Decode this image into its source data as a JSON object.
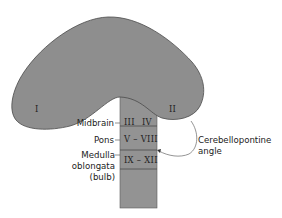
{
  "diagram": {
    "regions": {
      "left_hemisphere": "I",
      "right_hemisphere": "II"
    },
    "brainstem": [
      {
        "level": "Midbrain",
        "nerves": [
          "III",
          "IV"
        ]
      },
      {
        "level": "Pons",
        "nerves_range": "V – VIII"
      },
      {
        "level": "Medulla oblongata (bulb)",
        "nerves_range": "IX – XII"
      }
    ],
    "labels": {
      "midbrain": "Midbrain",
      "pons": "Pons",
      "medulla_line1": "Medulla",
      "medulla_line2": "oblongata",
      "medulla_line3": "(bulb)",
      "nerve_iii": "III",
      "nerve_iv": "IV",
      "nerves_v_viii": "V – VIII",
      "nerves_ix_xii": "IX – XII",
      "hemisphere_left": "I",
      "hemisphere_right": "II",
      "angle_line1": "Cerebellopontine",
      "angle_line2": "angle"
    },
    "colors": {
      "fill": "#8e8e8e",
      "stroke": "#4a4a4a"
    }
  }
}
